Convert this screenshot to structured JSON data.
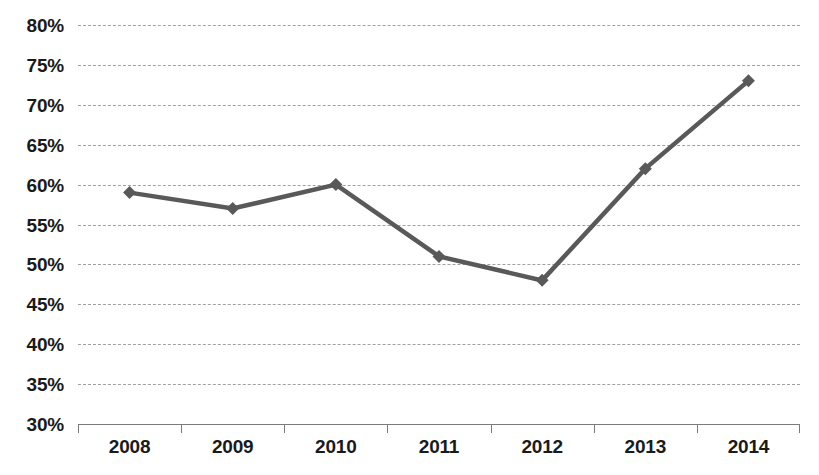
{
  "chart_data": {
    "type": "line",
    "title": "",
    "subtitle": "",
    "xlabel": "",
    "ylabel": "",
    "categories": [
      "2008",
      "2009",
      "2010",
      "2011",
      "2012",
      "2013",
      "2014"
    ],
    "values": [
      59,
      57,
      60,
      51,
      48,
      62,
      73
    ],
    "value_suffix": "%",
    "ylim": [
      30,
      80
    ],
    "ytick_step": 5,
    "ytick_labels": [
      "80%",
      "75%",
      "70%",
      "65%",
      "60%",
      "55%",
      "50%",
      "45%",
      "40%",
      "35%",
      "30%"
    ],
    "ytick_values": [
      80,
      75,
      70,
      65,
      60,
      55,
      50,
      45,
      40,
      35,
      30
    ],
    "grid": true,
    "grid_style": "dashed",
    "legend": "none",
    "marker": "diamond",
    "series": [
      {
        "name": "Series 1",
        "values": [
          59,
          57,
          60,
          51,
          48,
          62,
          73
        ]
      }
    ],
    "colors": {
      "line": "#595959",
      "marker": "#595959",
      "grid": "#a0a0a0",
      "axis": "#7a7a7a",
      "text": "#1a1a1a",
      "background": "#ffffff"
    }
  }
}
